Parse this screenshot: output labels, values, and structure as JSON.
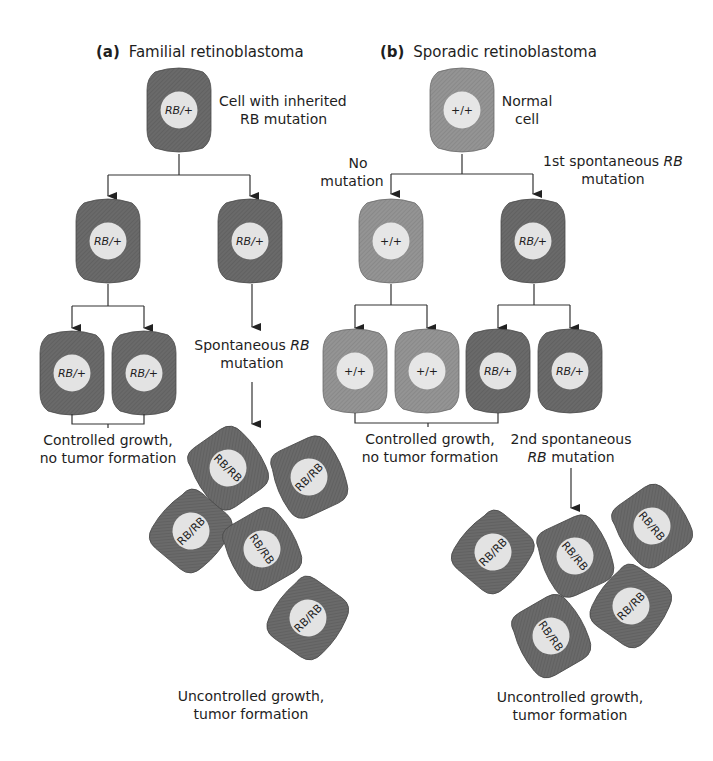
{
  "colors": {
    "background": "#ffffff",
    "mutant_cell_body": "#6e6e6e",
    "normal_cell_body": "#8e8e8e",
    "nucleus": "#e2e2e2",
    "line": "#333333",
    "text": "#1e1e1e"
  },
  "panel_a": {
    "label_prefix": "(a)",
    "title": "Familial retinoblastoma",
    "root_cell": {
      "genotype": "RB/+",
      "caption_line1": "Cell with inherited",
      "caption_line2": "RB mutation"
    },
    "left_branch": {
      "cell": {
        "genotype": "RB/+"
      },
      "daughters": [
        {
          "genotype": "RB/+"
        },
        {
          "genotype": "RB/+"
        }
      ],
      "outcome_line1": "Controlled growth,",
      "outcome_line2": "no tumor formation"
    },
    "right_branch": {
      "cell": {
        "genotype": "RB/+"
      },
      "event_line1_prefix": "Spontaneous ",
      "event_line1_italic": "RB",
      "event_line2": "mutation",
      "tumor_cells": [
        {
          "genotype": "RB/RB"
        },
        {
          "genotype": "RB/RB"
        },
        {
          "genotype": "RB/RB"
        },
        {
          "genotype": "RB/RB"
        },
        {
          "genotype": "RB/RB"
        }
      ],
      "outcome_line1": "Uncontrolled growth,",
      "outcome_line2": "tumor formation"
    }
  },
  "panel_b": {
    "label_prefix": "(b)",
    "title": "Sporadic retinoblastoma",
    "root_cell": {
      "genotype": "+/+",
      "caption_line1": "Normal",
      "caption_line2": "cell"
    },
    "left_branch": {
      "event_line1": "No",
      "event_line2": "mutation",
      "cell": {
        "genotype": "+/+"
      },
      "daughters": [
        {
          "genotype": "+/+"
        },
        {
          "genotype": "+/+"
        }
      ]
    },
    "right_branch": {
      "event_line1_prefix": "1st spontaneous ",
      "event_line1_italic": "RB",
      "event_line2": "mutation",
      "cell": {
        "genotype": "RB/+"
      },
      "daughters": [
        {
          "genotype": "RB/+"
        },
        {
          "genotype": "RB/+"
        }
      ],
      "event2_line1": "2nd spontaneous",
      "event2_line2_italic": "RB",
      "event2_line2_suffix": " mutation",
      "tumor_cells": [
        {
          "genotype": "RB/RB"
        },
        {
          "genotype": "RB/RB"
        },
        {
          "genotype": "RB/RB"
        },
        {
          "genotype": "RB/RB"
        },
        {
          "genotype": "RB/RB"
        }
      ],
      "outcome_line1": "Uncontrolled growth,",
      "outcome_line2": "tumor formation"
    },
    "controlled_outcome_line1": "Controlled growth,",
    "controlled_outcome_line2": "no tumor formation"
  }
}
